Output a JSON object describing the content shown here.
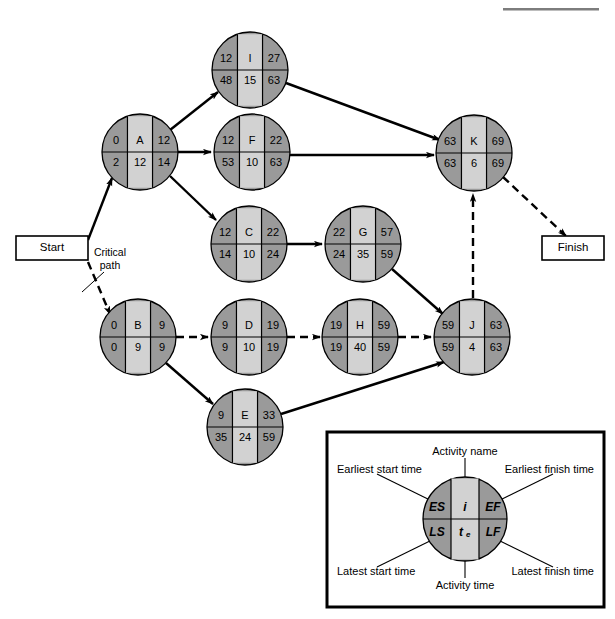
{
  "diagram": {
    "type": "activity-on-node-network",
    "title": "",
    "colors": {
      "node_side": "#9a9a9a",
      "node_center": "#d2d2d2",
      "node_outline": "#000000",
      "edge": "#000000",
      "background": "#ffffff"
    },
    "terminals": [
      {
        "id": "start",
        "label": "Start",
        "x": 52,
        "y": 248,
        "w": 72,
        "h": 24
      },
      {
        "id": "finish",
        "label": "Finish",
        "x": 573,
        "y": 248,
        "w": 62,
        "h": 24
      }
    ],
    "annotations": [
      {
        "id": "critical-path",
        "line1": "Critical",
        "line2": "path",
        "x": 110,
        "y": 258
      }
    ],
    "nodes": [
      {
        "id": "I",
        "name": "I",
        "es": "12",
        "ef": "27",
        "ls": "48",
        "te": "15",
        "lf": "63",
        "cx": 250,
        "cy": 70,
        "r": 38,
        "critical": false
      },
      {
        "id": "A",
        "name": "A",
        "es": "0",
        "ef": "12",
        "ls": "2",
        "te": "12",
        "lf": "14",
        "cx": 140,
        "cy": 152,
        "r": 38,
        "critical": false
      },
      {
        "id": "F",
        "name": "F",
        "es": "12",
        "ef": "22",
        "ls": "53",
        "te": "10",
        "lf": "63",
        "cx": 252,
        "cy": 152,
        "r": 38,
        "critical": false
      },
      {
        "id": "K",
        "name": "K",
        "es": "63",
        "ef": "69",
        "ls": "63",
        "te": "6",
        "lf": "69",
        "cx": 474,
        "cy": 153,
        "r": 38,
        "critical": true
      },
      {
        "id": "C",
        "name": "C",
        "es": "12",
        "ef": "22",
        "ls": "14",
        "te": "10",
        "lf": "24",
        "cx": 249,
        "cy": 244,
        "r": 38,
        "critical": false
      },
      {
        "id": "G",
        "name": "G",
        "es": "22",
        "ef": "57",
        "ls": "24",
        "te": "35",
        "lf": "59",
        "cx": 363,
        "cy": 244,
        "r": 38,
        "critical": false
      },
      {
        "id": "B",
        "name": "B",
        "es": "0",
        "ef": "9",
        "ls": "0",
        "te": "9",
        "lf": "9",
        "cx": 138,
        "cy": 337,
        "r": 38,
        "critical": true
      },
      {
        "id": "D",
        "name": "D",
        "es": "9",
        "ef": "19",
        "ls": "9",
        "te": "10",
        "lf": "19",
        "cx": 249,
        "cy": 337,
        "r": 38,
        "critical": true
      },
      {
        "id": "H",
        "name": "H",
        "es": "19",
        "ef": "59",
        "ls": "19",
        "te": "40",
        "lf": "59",
        "cx": 360,
        "cy": 337,
        "r": 38,
        "critical": true
      },
      {
        "id": "J",
        "name": "J",
        "es": "59",
        "ef": "63",
        "ls": "59",
        "te": "4",
        "lf": "63",
        "cx": 472,
        "cy": 337,
        "r": 38,
        "critical": true
      },
      {
        "id": "E",
        "name": "E",
        "es": "9",
        "ef": "33",
        "ls": "35",
        "te": "24",
        "lf": "59",
        "cx": 245,
        "cy": 427,
        "r": 38,
        "critical": false
      }
    ],
    "edges": [
      {
        "from": "start",
        "to": "A",
        "style": "solid"
      },
      {
        "from": "start",
        "to": "B",
        "style": "dashed"
      },
      {
        "from": "A",
        "to": "I",
        "style": "solid"
      },
      {
        "from": "A",
        "to": "F",
        "style": "solid"
      },
      {
        "from": "A",
        "to": "C",
        "style": "solid"
      },
      {
        "from": "I",
        "to": "K",
        "style": "solid"
      },
      {
        "from": "F",
        "to": "K",
        "style": "solid"
      },
      {
        "from": "C",
        "to": "G",
        "style": "solid"
      },
      {
        "from": "G",
        "to": "J",
        "style": "solid"
      },
      {
        "from": "B",
        "to": "D",
        "style": "dashed"
      },
      {
        "from": "B",
        "to": "E",
        "style": "solid"
      },
      {
        "from": "D",
        "to": "H",
        "style": "dashed"
      },
      {
        "from": "H",
        "to": "J",
        "style": "dashed"
      },
      {
        "from": "E",
        "to": "J",
        "style": "solid"
      },
      {
        "from": "J",
        "to": "K",
        "style": "dashed"
      },
      {
        "from": "K",
        "to": "finish",
        "style": "dashed"
      }
    ]
  },
  "legend": {
    "box": {
      "x": 327,
      "y": 432,
      "w": 277,
      "h": 175
    },
    "node": {
      "cx": 465,
      "cy": 519,
      "r": 42
    },
    "cells": {
      "es": "ES",
      "name": "i",
      "ef": "EF",
      "ls": "LS",
      "te": "t",
      "te_sub": "e",
      "lf": "LF"
    },
    "labels": {
      "activity_name": "Activity name",
      "earliest_start": "Earliest start time",
      "earliest_finish": "Earliest finish time",
      "latest_start": "Latest start time",
      "latest_finish": "Latest finish time",
      "activity_time": "Activity time"
    }
  }
}
